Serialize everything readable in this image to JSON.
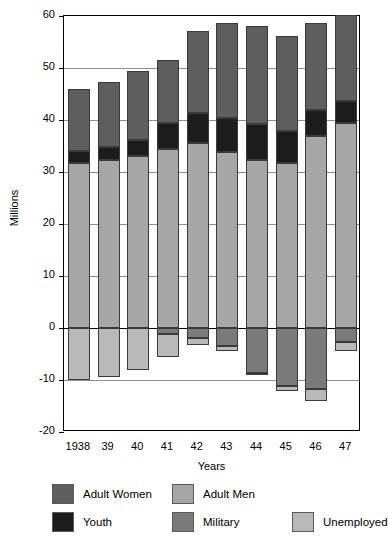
{
  "chart_data": {
    "type": "bar",
    "subtype": "stacked-bar-diverging",
    "title": "",
    "xlabel": "Years",
    "ylabel": "Millions",
    "ylim": [
      -20,
      60
    ],
    "yticks": [
      -20,
      -10,
      0,
      10,
      20,
      30,
      40,
      50,
      60
    ],
    "ytick_labels": [
      "-20",
      "-10",
      "0",
      "10",
      "20",
      "30",
      "40",
      "50",
      "60"
    ],
    "grid": true,
    "legend_position": "bottom",
    "categories": [
      "1938",
      "39",
      "40",
      "41",
      "42",
      "43",
      "44",
      "45",
      "46",
      "47"
    ],
    "series": [
      {
        "name": "Adult Men",
        "color": "#a6a6a6",
        "direction": "positive",
        "stack_order": 1,
        "values": [
          31.7,
          32.4,
          33.0,
          34.4,
          35.6,
          33.9,
          32.3,
          31.8,
          36.9,
          39.4
        ]
      },
      {
        "name": "Youth",
        "color": "#1c1c1c",
        "direction": "positive",
        "stack_order": 2,
        "values": [
          2.3,
          2.4,
          3.1,
          5.0,
          5.7,
          6.4,
          6.9,
          6.0,
          5.0,
          4.2
        ]
      },
      {
        "name": "Adult Women",
        "color": "#5e5e5e",
        "direction": "positive",
        "stack_order": 3,
        "values": [
          11.9,
          12.5,
          13.3,
          12.1,
          15.9,
          18.3,
          18.8,
          18.4,
          16.8,
          16.5
        ]
      },
      {
        "name": "Military",
        "color": "#7a7a7a",
        "direction": "negative",
        "stack_order": 1,
        "values": [
          0.0,
          0.0,
          0.0,
          1.2,
          2.0,
          3.5,
          8.6,
          11.2,
          11.8,
          2.6
        ]
      },
      {
        "name": "Unemployed",
        "color": "#b9b9b9",
        "direction": "negative",
        "stack_order": 2,
        "values": [
          10.0,
          9.4,
          8.1,
          4.3,
          1.2,
          1.0,
          0.5,
          1.0,
          2.2,
          1.9
        ]
      }
    ],
    "totals_positive": [
      45.9,
      47.3,
      49.4,
      51.5,
      57.2,
      58.6,
      58.0,
      56.2,
      58.7,
      60.1
    ],
    "totals_negative": [
      -10.0,
      -9.4,
      -8.1,
      -5.5,
      -3.2,
      -4.5,
      -9.1,
      -12.2,
      -14.0,
      -4.5
    ]
  },
  "axes": {
    "y_title": "Millions",
    "x_title": "Years"
  },
  "legend": {
    "items": [
      {
        "label": "Adult Women",
        "color": "#5e5e5e"
      },
      {
        "label": "Adult Men",
        "color": "#a6a6a6"
      },
      {
        "label": "Youth",
        "color": "#1c1c1c"
      },
      {
        "label": "Military",
        "color": "#7a7a7a"
      },
      {
        "label": "Unemployed",
        "color": "#b9b9b9"
      }
    ]
  }
}
